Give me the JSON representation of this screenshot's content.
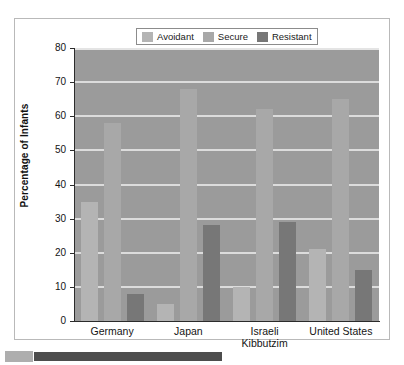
{
  "figure": {
    "frame_border_color": "#b9b9b9",
    "plot_background_color": "#9b9b9b",
    "gridline_color": "#dcdcdc"
  },
  "legend": {
    "position": "top-center",
    "entries": [
      {
        "label": "Avoidant",
        "color": "#b4b4b4",
        "swatch_name": "legend-swatch-avoidant"
      },
      {
        "label": "Secure",
        "color": "#a8a8a8",
        "swatch_name": "legend-swatch-secure"
      },
      {
        "label": "Resistant",
        "color": "#777777",
        "swatch_name": "legend-swatch-resistant"
      }
    ]
  },
  "axes": {
    "y_title": "Percentage of Infants",
    "y_ticks": [
      "80",
      "70",
      "60",
      "50",
      "40",
      "30",
      "20",
      "10",
      "0"
    ],
    "x_labels": [
      "Germany",
      "Japan",
      "Israeli\nKibbutzim",
      "United States"
    ]
  },
  "caption": {
    "swatch_color": "#aeaeae",
    "bar_color": "#4d4d4d"
  },
  "chart_data": {
    "type": "bar",
    "title": "",
    "subtitle": "",
    "xlabel": "",
    "ylabel": "Percentage of Infants",
    "ylim": [
      0,
      80
    ],
    "ytick_step": 10,
    "grid": true,
    "legend_position": "top-center",
    "categories": [
      "Germany",
      "Japan",
      "Israeli Kibbutzim",
      "United States"
    ],
    "series": [
      {
        "name": "Avoidant",
        "color": "#b4b4b4",
        "values": [
          35,
          5,
          10,
          21
        ]
      },
      {
        "name": "Secure",
        "color": "#a8a8a8",
        "values": [
          58,
          68,
          62,
          65
        ]
      },
      {
        "name": "Resistant",
        "color": "#777777",
        "values": [
          8,
          28,
          29,
          15
        ]
      }
    ]
  }
}
